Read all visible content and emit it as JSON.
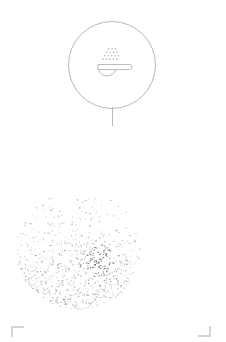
{
  "canvas": {
    "width": 226,
    "height": 342,
    "background": "#ffffff"
  },
  "badge": {
    "name": "seasoning-spoon-marker",
    "shape": "circle",
    "center_x": 112,
    "center_y": 65,
    "diameter": 88,
    "stroke_color": "#b9b9b9",
    "fill_color": "#ffffff",
    "icon": {
      "name": "spoon-with-grains-icon",
      "description": "spoon with seasoning grains",
      "stroke_color": "#b9b9b9",
      "grain_rows": [
        3,
        4,
        5,
        5
      ],
      "grain_count": 17
    }
  },
  "stem": {
    "name": "marker-stem",
    "x": 112,
    "top": 107,
    "length": 19,
    "color": "#b9b9b9"
  },
  "cloud": {
    "name": "particle-scatter-cloud",
    "center_x": 78,
    "center_y": 100,
    "radius": 62,
    "particle_count": 2600,
    "color": "#555555",
    "description": "scattered speckle particle cloud"
  },
  "crop_marks": {
    "color": "#d4d4d4",
    "left": {
      "label": "bottom-left-crop-mark",
      "x": 11,
      "y": 326
    },
    "right": {
      "label": "bottom-right-crop-mark",
      "x": 198,
      "y": 326
    }
  }
}
